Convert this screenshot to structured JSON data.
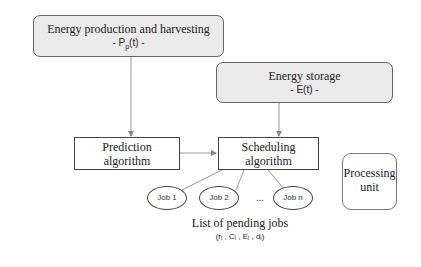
{
  "diagram": {
    "energy_production": {
      "title": "Energy production and harvesting",
      "formula_prefix": "- P",
      "formula_sub": "p",
      "formula_suffix": "(t) -"
    },
    "energy_storage": {
      "title": "Energy storage",
      "formula": "- E(t) -"
    },
    "prediction": {
      "line1": "Prediction",
      "line2": "algorithm"
    },
    "scheduling": {
      "line1": "Scheduling",
      "line2": "algorithm"
    },
    "processing_unit": {
      "line1": "Processing",
      "line2": "unit"
    },
    "jobs": [
      {
        "label": "Job 1"
      },
      {
        "label": "Job 2"
      },
      {
        "label": "Job n"
      }
    ],
    "ellipsis": "...",
    "pending_list": {
      "title": "List of pending jobs",
      "tuple": "(rᵢ , Cᵢ , Eᵢ , dᵢ)"
    }
  }
}
